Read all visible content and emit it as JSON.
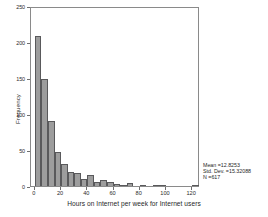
{
  "chart_data": {
    "type": "bar",
    "title": "",
    "subtitle": "",
    "xlabel": "Hours on Internet per week for Internet users",
    "ylabel": "Frequency",
    "xlim": [
      -3,
      126
    ],
    "ylim": [
      0,
      250
    ],
    "grid": false,
    "legend_position": "none",
    "bin_width": 5,
    "x_ticks": [
      0,
      20,
      40,
      60,
      80,
      100,
      120
    ],
    "x_tick_labels": [
      "0",
      "20",
      "40",
      "60",
      "80",
      "100",
      "120"
    ],
    "y_ticks": [
      0,
      50,
      100,
      150,
      200,
      250
    ],
    "y_tick_labels": [
      "0",
      "50",
      "100",
      "150",
      "200",
      "250"
    ],
    "bar_color": "#9d9d9d",
    "bar_edge_color": "#59595b",
    "bin_centers": [
      2.5,
      7.5,
      12.5,
      17.5,
      22.5,
      27.5,
      32.5,
      37.5,
      42.5,
      47.5,
      52.5,
      57.5,
      62.5,
      67.5,
      72.5,
      82.5,
      92.5,
      97.5,
      122.5
    ],
    "bin_starts": [
      0,
      5,
      10,
      15,
      20,
      25,
      30,
      35,
      40,
      45,
      50,
      55,
      60,
      65,
      70,
      80,
      90,
      95,
      120
    ],
    "values": [
      208,
      149,
      90,
      47,
      30,
      20,
      18,
      10,
      15,
      6,
      8,
      6,
      3,
      2,
      4,
      1,
      2,
      2,
      1
    ]
  },
  "annotations": {
    "mean_line": "Mean =12.8253",
    "std_dev_line": "Std. Dev. =15.32088",
    "n_line": "N =617"
  }
}
